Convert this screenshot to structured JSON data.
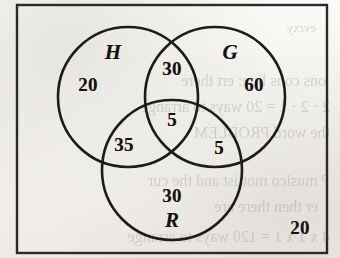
{
  "figure": {
    "type": "venn-diagram",
    "set_count": 3,
    "universe_label": "",
    "outside_value": "20"
  },
  "frame": {
    "x": 17,
    "y": 5,
    "width": 310,
    "height": 248,
    "stroke_color": "#2b2a28"
  },
  "sets": [
    {
      "id": "H",
      "label": "H",
      "cx": 128,
      "cy": 97,
      "r": 70,
      "label_x": 113,
      "label_y": 52
    },
    {
      "id": "G",
      "label": "G",
      "cx": 215,
      "cy": 97,
      "r": 70,
      "label_x": 230,
      "label_y": 52
    },
    {
      "id": "R",
      "label": "R",
      "cx": 172,
      "cy": 170,
      "r": 70,
      "label_x": 172,
      "label_y": 220
    }
  ],
  "regions": [
    {
      "id": "H-only",
      "label": "H only",
      "value": "20",
      "x": 88,
      "y": 85
    },
    {
      "id": "G-only",
      "label": "G only",
      "value": "60",
      "x": 254,
      "y": 85
    },
    {
      "id": "R-only",
      "label": "R only",
      "value": "30",
      "x": 172,
      "y": 196
    },
    {
      "id": "HG-only",
      "label": "H and G only",
      "value": "30",
      "x": 172,
      "y": 69
    },
    {
      "id": "HR-only",
      "label": "H and R only",
      "value": "35",
      "x": 124,
      "y": 145
    },
    {
      "id": "GR-only",
      "label": "G and R only",
      "value": "5",
      "x": 219,
      "y": 148
    },
    {
      "id": "HGR",
      "label": "H and G and R",
      "value": "5",
      "x": 172,
      "y": 120
    },
    {
      "id": "outside",
      "label": "outside all sets",
      "value": "20",
      "x": 300,
      "y": 228
    }
  ],
  "bleed_text": [
    {
      "text": "evrxy",
      "x": 316,
      "y": 20,
      "size": 13
    },
    {
      "text": "ons cons line: ert there",
      "x": 326,
      "y": 72,
      "size": 16
    },
    {
      "text": "2 · 2 · 1 = 20 ways to arrange",
      "x": 330,
      "y": 98,
      "size": 16
    },
    {
      "text": "the word PROBLEM",
      "x": 330,
      "y": 124,
      "size": 16
    },
    {
      "text": "P musico mottist and the cur",
      "x": 330,
      "y": 172,
      "size": 16
    },
    {
      "text": "er then there are",
      "x": 318,
      "y": 198,
      "size": 16
    },
    {
      "text": "4 x 1 x 1 = 120 ways to arrange",
      "x": 330,
      "y": 228,
      "size": 16
    }
  ],
  "chart_data": {
    "type": "venn",
    "title": "",
    "sets": [
      "H",
      "G",
      "R"
    ],
    "region_values": {
      "H_only": 20,
      "G_only": 60,
      "R_only": 30,
      "H_and_G_only": 30,
      "H_and_R_only": 35,
      "G_and_R_only": 5,
      "H_and_G_and_R": 5,
      "outside": 20
    },
    "totals": {
      "H": 90,
      "G": 100,
      "R": 75,
      "universe": 185
    }
  }
}
